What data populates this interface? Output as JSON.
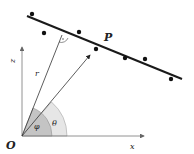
{
  "diagram": {
    "labels": {
      "point": "P",
      "origin": "O",
      "z_axis": "z",
      "x_axis": "x",
      "radius": "r",
      "angle_phi": "φ",
      "angle_theta": "θ",
      "right_angle_mark": "·"
    },
    "data_point_count": 7,
    "colors": {
      "line": "#1a1a1a",
      "axis": "#777777",
      "theta_fill": "#e6e6e6",
      "phi_fill": "#c4c4c4",
      "dot": "#111111"
    }
  }
}
